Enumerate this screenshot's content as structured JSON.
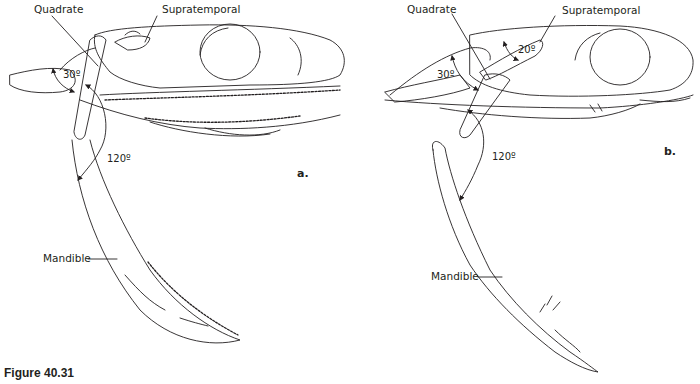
{
  "figure": {
    "caption": "Figure 40.31",
    "line_color": "#231f20",
    "background": "#ffffff"
  },
  "panel_a": {
    "panel_label": "a.",
    "labels": {
      "quadrate": "Quadrate",
      "supratemporal": "Supratemporal",
      "mandible": "Mandible"
    },
    "angles": {
      "quadrate_rotation": "30º",
      "mandible_rotation": "120º"
    }
  },
  "panel_b": {
    "panel_label": "b.",
    "labels": {
      "quadrate": "Quadrate",
      "supratemporal": "Supratemporal",
      "mandible": "Mandible"
    },
    "angles": {
      "supratemporal_rotation": "20º",
      "quadrate_rotation": "30º",
      "mandible_rotation": "120º"
    }
  }
}
